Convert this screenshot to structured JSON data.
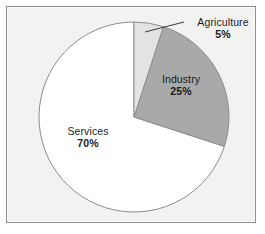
{
  "chart_data": {
    "type": "pie",
    "title": "",
    "categories": [
      "Agriculture",
      "Industry",
      "Services"
    ],
    "values": [
      5,
      25,
      70
    ],
    "value_labels": [
      "5%",
      "25%",
      "70%"
    ],
    "units": "percent",
    "total": 100,
    "start_angle_deg": 0,
    "direction": "clockwise",
    "legend": "none",
    "grid": false,
    "slices": [
      {
        "label": "Agriculture",
        "value": 5,
        "value_label": "5%",
        "color": "#e3e3e3",
        "sweep_deg": 18,
        "label_placement": "outside",
        "leader_line": true
      },
      {
        "label": "Industry",
        "value": 25,
        "value_label": "25%",
        "color": "#a9a9a9",
        "sweep_deg": 90,
        "label_placement": "inside",
        "leader_line": false
      },
      {
        "label": "Services",
        "value": 70,
        "value_label": "70%",
        "color": "#ffffff",
        "sweep_deg": 252,
        "label_placement": "inside",
        "leader_line": false
      }
    ]
  },
  "frame": {
    "background_color": "#f2f2f1",
    "border_color": "#8e8e8e",
    "outer_background": "#ffffff"
  },
  "pie": {
    "center_x": 134,
    "center_y": 117,
    "radius": 95,
    "outline_color": "#8c8c8c",
    "leader_line_color": "#3a3a3a"
  },
  "labels": {
    "agriculture": {
      "category": "Agriculture",
      "percent": "5%"
    },
    "industry": {
      "category": "Industry",
      "percent": "25%"
    },
    "services": {
      "category": "Services",
      "percent": "70%"
    }
  }
}
